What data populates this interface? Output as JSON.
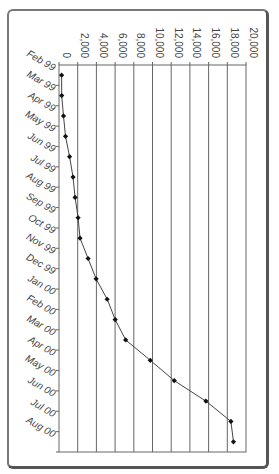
{
  "chart_data": {
    "type": "line",
    "orientation": "rotated-90",
    "title": "",
    "xlabel": "",
    "ylabel": "",
    "categories": [
      "Feb 99",
      "Mar 99",
      "Apr 99",
      "May 99",
      "Jun 99",
      "Jul 99",
      "Aug 99",
      "Sep 99",
      "Oct 99",
      "Nov 99",
      "Dec 99",
      "Jan 00",
      "Feb 00",
      "Mar 00",
      "Apr 00",
      "May 00",
      "Jun 00",
      "Jul 00",
      "Aug 00"
    ],
    "values": [
      280,
      290,
      480,
      700,
      1130,
      1500,
      1720,
      2040,
      2250,
      3110,
      3970,
      5150,
      6010,
      7130,
      9760,
      12330,
      15710,
      18390,
      18660
    ],
    "value_ticks": [
      "0",
      "2,000",
      "4,000",
      "6,000",
      "8,000",
      "10,000",
      "12,000",
      "14,000",
      "16,000",
      "18,000",
      "20,000"
    ],
    "ylim": [
      0,
      20000
    ],
    "grid": true,
    "legend": null,
    "marker": "diamond",
    "line_color": "#444444",
    "marker_color": "#111111"
  }
}
